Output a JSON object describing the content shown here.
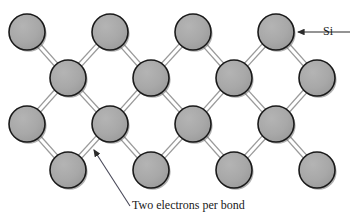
{
  "figure": {
    "background_color": "#ffffff"
  },
  "atom": {
    "label": "Si",
    "fill_color": "#a8a8a8",
    "stroke_color": "#1a1a1a",
    "radius": 18,
    "shadow_color": "#6f6f6f"
  },
  "bond": {
    "color": "#9a9a9a",
    "style": "double-line",
    "electrons_per_bond": 2
  },
  "annotations": {
    "si": {
      "text": "Si",
      "arrow_from_x": 350,
      "arrow_from_y": 32,
      "arrow_to_x": 298,
      "arrow_to_y": 32
    },
    "two_electrons": {
      "text": "Two electrons per bond",
      "arrow_from_x": 130,
      "arrow_from_y": 206,
      "arrow_to_x": 94,
      "arrow_to_y": 150
    }
  },
  "chart_data": {
    "type": "diagram",
    "rows": [
      {
        "row": 1,
        "y": 32,
        "x_positions": [
          27,
          110,
          193,
          276
        ]
      },
      {
        "row": 2,
        "y": 78,
        "x_positions": [
          68,
          151,
          234,
          317
        ]
      },
      {
        "row": 3,
        "y": 124,
        "x_positions": [
          27,
          110,
          193,
          276
        ]
      },
      {
        "row": 4,
        "y": 170,
        "x_positions": [
          68,
          151,
          234,
          317
        ]
      }
    ],
    "atom_count": 16,
    "atom_radius": 18,
    "bond_offset": 2.2,
    "labels": [
      "Si",
      "Two electrons per bond"
    ]
  }
}
